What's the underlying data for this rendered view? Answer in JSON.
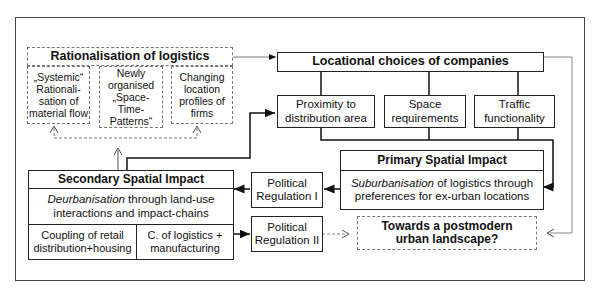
{
  "rationalisation": {
    "title": "Rationalisation of logistics",
    "items": [
      {
        "line1": "„Systemic“",
        "line2": "Rationali-",
        "line3": "sation of",
        "line4": "material flow"
      },
      {
        "line1": "Newly",
        "line2": "organised",
        "line3": "„Space-Time-",
        "line4": "Patterns“"
      },
      {
        "line1": "Changing",
        "line2": "location",
        "line3": "profiles of",
        "line4": "firms"
      }
    ]
  },
  "locational": {
    "title": "Locational choices of companies",
    "factors": [
      {
        "line1": "Proximity to",
        "line2": "distribution area"
      },
      {
        "line1": "Space",
        "line2": "requirements"
      },
      {
        "line1": "Traffic",
        "line2": "functionality"
      }
    ]
  },
  "primary": {
    "title": "Primary Spatial Impact",
    "italic": "Suburbanisation",
    "rest1": " of logistics through",
    "line2": "preferences for ex-urban locations"
  },
  "secondary": {
    "title": "Secondary Spatial Impact",
    "italic": "Deurbanisation",
    "rest1": " through land-use",
    "line2": "interactions and impact-chains",
    "coupling": [
      {
        "line1": "Coupling of retail",
        "line2": "distribution+housing"
      },
      {
        "line1": "C. of logistics +",
        "line2": "manufacturing"
      }
    ]
  },
  "regulation": [
    {
      "line1": "Political",
      "line2": "Regulation I"
    },
    {
      "line1": "Political",
      "line2": "Regulation II"
    }
  ],
  "outcome": {
    "line1": "Towards a postmodern",
    "line2": "urban landscape?"
  }
}
